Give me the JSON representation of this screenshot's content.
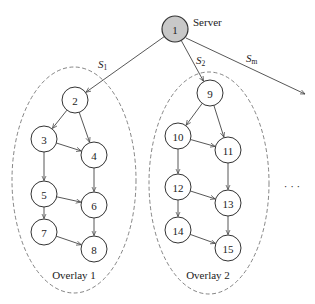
{
  "diagram": {
    "server": {
      "id": "1",
      "label": "Server",
      "color": "#c8c8c8"
    },
    "streams": [
      {
        "label": "S",
        "subscript": "1"
      },
      {
        "label": "S",
        "subscript": "2"
      },
      {
        "label": "S",
        "subscript": "m"
      }
    ],
    "overlays": [
      {
        "label": "Overlay 1",
        "nodes": [
          "2",
          "3",
          "4",
          "5",
          "6",
          "7",
          "8"
        ]
      },
      {
        "label": "Overlay 2",
        "nodes": [
          "9",
          "10",
          "11",
          "12",
          "13",
          "14",
          "15"
        ]
      }
    ],
    "ellipsis": "· · ·",
    "nodes": [
      {
        "id": "1",
        "x": 175,
        "y": 29
      },
      {
        "id": "2",
        "x": 75,
        "y": 100
      },
      {
        "id": "3",
        "x": 44,
        "y": 139
      },
      {
        "id": "4",
        "x": 94,
        "y": 155
      },
      {
        "id": "5",
        "x": 44,
        "y": 194
      },
      {
        "id": "6",
        "x": 94,
        "y": 205
      },
      {
        "id": "7",
        "x": 44,
        "y": 232
      },
      {
        "id": "8",
        "x": 94,
        "y": 249
      },
      {
        "id": "9",
        "x": 210,
        "y": 93
      },
      {
        "id": "10",
        "x": 178,
        "y": 136
      },
      {
        "id": "11",
        "x": 228,
        "y": 150
      },
      {
        "id": "12",
        "x": 178,
        "y": 187
      },
      {
        "id": "13",
        "x": 228,
        "y": 203
      },
      {
        "id": "14",
        "x": 178,
        "y": 230
      },
      {
        "id": "15",
        "x": 228,
        "y": 248
      }
    ],
    "edges": [
      [
        "1",
        "2"
      ],
      [
        "1",
        "9"
      ],
      [
        "2",
        "3"
      ],
      [
        "2",
        "4"
      ],
      [
        "3",
        "4"
      ],
      [
        "3",
        "5"
      ],
      [
        "4",
        "6"
      ],
      [
        "5",
        "6"
      ],
      [
        "5",
        "7"
      ],
      [
        "6",
        "8"
      ],
      [
        "7",
        "8"
      ],
      [
        "9",
        "10"
      ],
      [
        "9",
        "11"
      ],
      [
        "10",
        "11"
      ],
      [
        "10",
        "12"
      ],
      [
        "11",
        "13"
      ],
      [
        "12",
        "13"
      ],
      [
        "12",
        "14"
      ],
      [
        "13",
        "15"
      ],
      [
        "14",
        "15"
      ]
    ]
  }
}
